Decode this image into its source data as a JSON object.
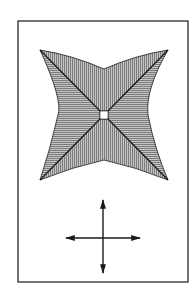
{
  "figure": {
    "frame": {
      "x": 18,
      "y": 21,
      "w": 170,
      "h": 261
    },
    "colors": {
      "line": "#1a1a1a",
      "hatch": "#555555",
      "fill": "#bdbdbd",
      "background": "#ffffff"
    },
    "star": {
      "corners": {
        "tl": [
          40,
          50
        ],
        "tr": [
          168,
          50
        ],
        "bl": [
          40,
          180
        ],
        "br": [
          168,
          180
        ]
      },
      "center": [
        104,
        115
      ],
      "center_square_size": 8,
      "quadrants": [
        {
          "name": "top",
          "hatch": "vertical"
        },
        {
          "name": "bottom",
          "hatch": "vertical"
        },
        {
          "name": "left",
          "hatch": "horizontal"
        },
        {
          "name": "right",
          "hatch": "horizontal"
        }
      ]
    },
    "arrows": {
      "center": [
        103,
        238
      ],
      "vertical": {
        "y1": 200,
        "y2": 273
      },
      "horizontal": {
        "x1": 66,
        "x2": 140
      },
      "icon": "four-direction-arrows-icon"
    }
  }
}
